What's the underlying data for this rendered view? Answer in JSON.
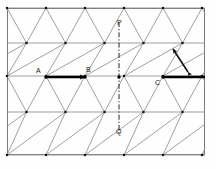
{
  "figure": {
    "type": "triangular-lattice-diagram",
    "background_color": "#fefefe",
    "frame": {
      "color": "#7a7a7a",
      "x": 7,
      "y": 8,
      "width": 198,
      "height": 147
    },
    "lattice": {
      "line_color": "#8a8a8a",
      "vertex_color": "#111111",
      "row_y": [
        8,
        43,
        76,
        112,
        155
      ],
      "column_spacing": 39,
      "row_offset": 19.5,
      "origin_x": 7
    },
    "labels": [
      {
        "id": "label-A",
        "text": "A",
        "x": 36,
        "y": 67
      },
      {
        "id": "label-B",
        "text": "B",
        "x": 86,
        "y": 66
      },
      {
        "id": "label-C",
        "text": "C",
        "x": 155,
        "y": 79
      },
      {
        "id": "label-P",
        "text": "P",
        "x": 117,
        "y": 19
      },
      {
        "id": "label-Q",
        "text": "Q",
        "x": 116,
        "y": 128
      }
    ],
    "vectors": [
      {
        "id": "translation-vector-AB",
        "from_label": "A",
        "to_label": "B",
        "x1": 46,
        "y1": 77,
        "x2": 85,
        "y2": 77,
        "color": "#000000",
        "stroke_width": 2.4,
        "arrowhead": "end"
      },
      {
        "id": "translation-vector-C-right",
        "from_label": "C",
        "to_label": "",
        "x1": 163,
        "y1": 77,
        "x2": 205,
        "y2": 77,
        "color": "#000000",
        "stroke_width": 2.4,
        "arrowhead": "none"
      }
    ],
    "mirror_line": {
      "id": "mirror-line-PQ",
      "style": "dash-dot",
      "x": 119,
      "y1": 22,
      "y2": 133,
      "color": "#222222",
      "stroke_width": 1
    },
    "double_arrow": {
      "id": "double-headed-arrow",
      "x1": 188,
      "y1": 72,
      "x2": 173,
      "y2": 49,
      "color": "#111111",
      "stroke_width": 1.6,
      "arrowhead": "both",
      "description": "double-headed arrow indicating reflection across diagonal"
    }
  }
}
